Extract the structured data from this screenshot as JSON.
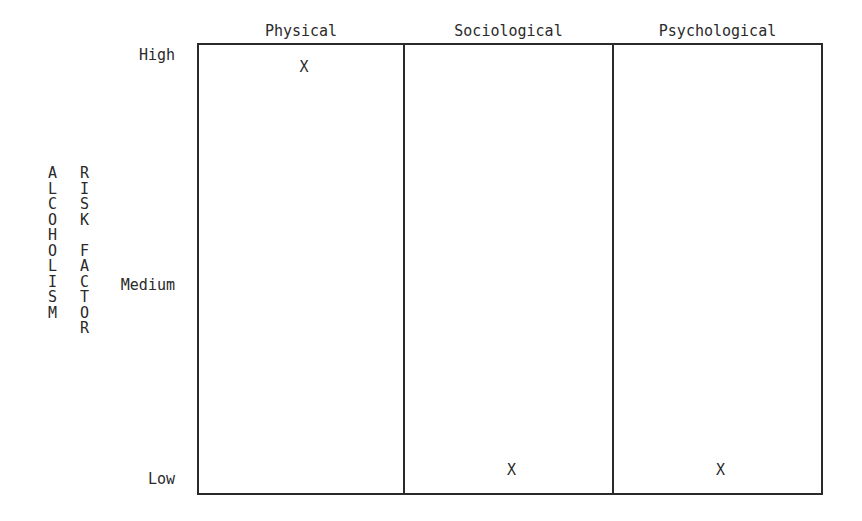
{
  "chart_data": {
    "type": "table",
    "title": "",
    "categories": [
      "Physical",
      "Sociological",
      "Psychological"
    ],
    "y_levels": [
      "Low",
      "Medium",
      "High"
    ],
    "ylabel_lines": [
      "ALCOHOLISM",
      "RISK FACTOR"
    ],
    "marker": "X",
    "series": [
      {
        "name": "Risk level",
        "values": [
          "High",
          "Low",
          "Low"
        ]
      }
    ],
    "grid": false
  }
}
